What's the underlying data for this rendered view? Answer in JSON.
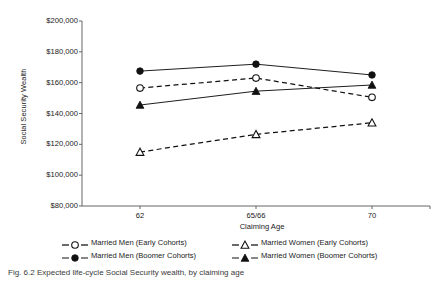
{
  "figure": {
    "caption": "Fig. 6.2   Expected life-cycle Social Security wealth, by claiming age"
  },
  "chart_data": {
    "type": "line",
    "title": "",
    "xlabel": "Claiming Age",
    "ylabel": "Social Security Wealth",
    "categories": [
      "62",
      "65/66",
      "70"
    ],
    "x_tick_labels": [
      "62",
      "65/66",
      "70"
    ],
    "y_tick_labels": [
      "$80,000",
      "$100,000",
      "$120,000",
      "$140,000",
      "$160,000",
      "$180,000",
      "$200,000"
    ],
    "y_tick_values": [
      80000,
      100000,
      120000,
      140000,
      160000,
      180000,
      200000
    ],
    "ylim": [
      80000,
      200000
    ],
    "grid": false,
    "legend_position": "bottom",
    "series": [
      {
        "name": "Married Men (Early Cohorts)",
        "marker": "open-circle",
        "line_style": "dashed",
        "values": [
          156500,
          163000,
          150500
        ]
      },
      {
        "name": "Married Women (Early Cohorts)",
        "marker": "open-triangle",
        "line_style": "dashed",
        "values": [
          115000,
          126500,
          134000
        ]
      },
      {
        "name": "Married Men (Boomer Cohorts)",
        "marker": "filled-circle",
        "line_style": "solid",
        "values": [
          167500,
          172000,
          165000
        ]
      },
      {
        "name": "Married Women (Boomer Cohorts)",
        "marker": "filled-triangle",
        "line_style": "solid",
        "values": [
          145500,
          154500,
          158500
        ]
      }
    ]
  }
}
